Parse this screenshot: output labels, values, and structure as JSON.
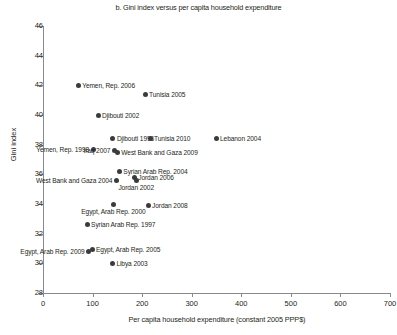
{
  "chart_data": {
    "type": "scatter",
    "title": "b. Gini index versus per capita household expenditure",
    "xlabel": "Per capita household expenditure (constant 2005 PPP$)",
    "ylabel": "Gini index",
    "xlim": [
      0,
      700
    ],
    "ylim": [
      28,
      46
    ],
    "xticks": [
      "0",
      "100",
      "200",
      "300",
      "400",
      "500",
      "600",
      "700"
    ],
    "yticks": [
      "28",
      "30",
      "32",
      "34",
      "36",
      "38",
      "40",
      "42",
      "44",
      "46"
    ],
    "grid": false,
    "legend": "none",
    "marker_color": "#3b3a3c",
    "axis_color": "#8a8a8d",
    "points": [
      {
        "label": "Yemen, Rep. 2006",
        "x": 71,
        "y": 42.0,
        "pos": "right"
      },
      {
        "label": "Tunisia 2005",
        "x": 206,
        "y": 41.4,
        "pos": "right"
      },
      {
        "label": "Djibouti 2002",
        "x": 111,
        "y": 40.0,
        "pos": "right"
      },
      {
        "label": "Djibouti 1996",
        "x": 141,
        "y": 38.4,
        "pos": "right"
      },
      {
        "label": "Tunisia 2010",
        "x": 216,
        "y": 38.4,
        "pos": "right"
      },
      {
        "label": "Lebanon 2004",
        "x": 349,
        "y": 38.4,
        "pos": "right"
      },
      {
        "label": "Yemen, Rep. 1998",
        "x": 101,
        "y": 37.7,
        "pos": "left"
      },
      {
        "label": "Iraq 2007",
        "x": 144,
        "y": 37.6,
        "pos": "left"
      },
      {
        "label": "West Bank and Gaza 2009",
        "x": 150,
        "y": 37.5,
        "pos": "right"
      },
      {
        "label": "Syrian Arab Rep. 2004",
        "x": 154,
        "y": 36.2,
        "pos": "right"
      },
      {
        "label": "Jordan 2006",
        "x": 184,
        "y": 35.8,
        "pos": "right"
      },
      {
        "label": "West Bank and Gaza 2004",
        "x": 148,
        "y": 35.6,
        "pos": "left"
      },
      {
        "label": "Jordan 2002",
        "x": 188,
        "y": 35.6,
        "pos": "below"
      },
      {
        "label": "Egypt, Arab Rep. 2000",
        "x": 142,
        "y": 34.0,
        "pos": "below"
      },
      {
        "label": "Jordan 2008",
        "x": 212,
        "y": 33.9,
        "pos": "right"
      },
      {
        "label": "Syrian Arab Rep. 1997",
        "x": 89,
        "y": 32.6,
        "pos": "right"
      },
      {
        "label": "Egypt, Arab Rep. 2005",
        "x": 99,
        "y": 30.9,
        "pos": "right"
      },
      {
        "label": "Egypt, Arab Rep. 2009",
        "x": 92,
        "y": 30.8,
        "pos": "left"
      },
      {
        "label": "Libya 2003",
        "x": 140,
        "y": 30.0,
        "pos": "right"
      }
    ]
  }
}
